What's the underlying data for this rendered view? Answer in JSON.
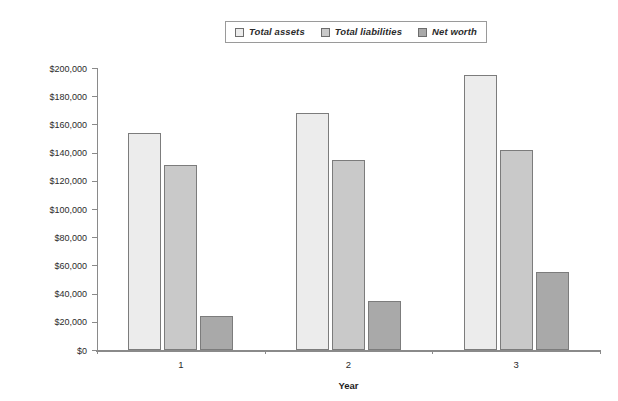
{
  "legend": {
    "position": "top-center",
    "entries": [
      {
        "label": "Total assets",
        "color": "#ececec"
      },
      {
        "label": "Total liabilities",
        "color": "#c9c9c9"
      },
      {
        "label": "Net worth",
        "color": "#a9a9a9"
      }
    ]
  },
  "axes": {
    "x_title": "Year",
    "x_tick_labels": [
      "1",
      "2",
      "3"
    ],
    "y_tick_labels": [
      "$200,000",
      "$180,000",
      "$160,000",
      "$140,000",
      "$120,000",
      "$100,000",
      "$80,000",
      "$60,000",
      "$40,000",
      "$20,000",
      "$0"
    ]
  },
  "chart_data": {
    "type": "bar",
    "title": "",
    "xlabel": "Year",
    "ylabel": "",
    "categories": [
      "1",
      "2",
      "3"
    ],
    "series": [
      {
        "name": "Total assets",
        "color": "#ececec",
        "values": [
          154000,
          168000,
          195000
        ]
      },
      {
        "name": "Total liabilities",
        "color": "#c9c9c9",
        "values": [
          131000,
          135000,
          142000
        ]
      },
      {
        "name": "Net worth",
        "color": "#a9a9a9",
        "values": [
          24000,
          35000,
          55000
        ]
      }
    ],
    "ylim": [
      0,
      200000
    ],
    "ytick_step": 20000,
    "ytick_prefix": "$",
    "grid": false,
    "legend_position": "top-center"
  }
}
